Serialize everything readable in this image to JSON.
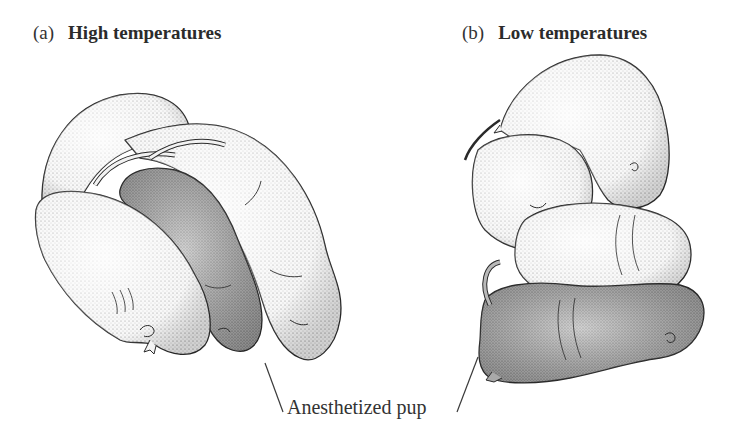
{
  "figure": {
    "panels": [
      {
        "letter": "(a)",
        "title": "High temperatures",
        "description": "Naked mole-rat pups huddled loosely side by side; anesthetized pup (shaded gray) in the middle of the group"
      },
      {
        "letter": "(b)",
        "title": "Low temperatures",
        "description": "Naked mole-rat pups piled tightly on top of one another; anesthetized pup (shaded gray) at the bottom of the pile"
      }
    ],
    "callout": {
      "text": "Anesthetized pup"
    },
    "colors": {
      "background": "#ffffff",
      "animal_light": "#f4f4f4",
      "animal_anesthetized": "#b9b9b9",
      "stipple": "#555555",
      "outline": "#2a2a2a"
    }
  }
}
